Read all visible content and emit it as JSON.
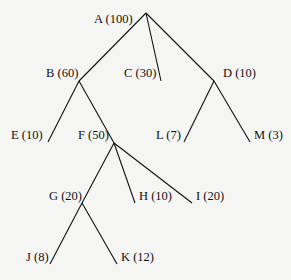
{
  "diagram": {
    "type": "tree",
    "nodes": [
      {
        "id": "A",
        "label": "A (100)",
        "value": 100,
        "x": 146,
        "y": 13,
        "lx": 94,
        "ly": 12
      },
      {
        "id": "B",
        "label": "B (60)",
        "value": 60,
        "x": 79,
        "y": 81,
        "lx": 46,
        "ly": 66
      },
      {
        "id": "C",
        "label": "C (30)",
        "value": 30,
        "x": 161,
        "y": 81,
        "lx": 124,
        "ly": 66
      },
      {
        "id": "D",
        "label": "D (10)",
        "value": 10,
        "x": 214,
        "y": 81,
        "lx": 223,
        "ly": 66
      },
      {
        "id": "E",
        "label": "E (10)",
        "value": 10,
        "x": 48,
        "y": 142,
        "lx": 11,
        "ly": 128
      },
      {
        "id": "F",
        "label": "F (50)",
        "value": 50,
        "x": 114,
        "y": 143,
        "lx": 78,
        "ly": 128
      },
      {
        "id": "L",
        "label": "L (7)",
        "value": 7,
        "x": 184,
        "y": 142,
        "lx": 156,
        "ly": 128
      },
      {
        "id": "M",
        "label": "M (3)",
        "value": 3,
        "x": 250,
        "y": 142,
        "lx": 254,
        "ly": 128
      },
      {
        "id": "G",
        "label": "G (20)",
        "value": 20,
        "x": 82,
        "y": 203,
        "lx": 49,
        "ly": 189
      },
      {
        "id": "H",
        "label": "H (10)",
        "value": 10,
        "x": 135,
        "y": 203,
        "lx": 139,
        "ly": 189
      },
      {
        "id": "I",
        "label": "I (20)",
        "value": 20,
        "x": 192,
        "y": 203,
        "lx": 196,
        "ly": 189
      },
      {
        "id": "J",
        "label": "J (8)",
        "value": 8,
        "x": 50,
        "y": 264,
        "lx": 26,
        "ly": 250
      },
      {
        "id": "K",
        "label": "K (12)",
        "value": 12,
        "x": 117,
        "y": 264,
        "lx": 121,
        "ly": 250
      }
    ],
    "edges": [
      [
        "A",
        "B"
      ],
      [
        "A",
        "C"
      ],
      [
        "A",
        "D"
      ],
      [
        "B",
        "E"
      ],
      [
        "B",
        "F"
      ],
      [
        "D",
        "L"
      ],
      [
        "D",
        "M"
      ],
      [
        "F",
        "G"
      ],
      [
        "F",
        "H"
      ],
      [
        "F",
        "I"
      ],
      [
        "G",
        "J"
      ],
      [
        "G",
        "K"
      ]
    ],
    "line_color": "#111111"
  }
}
